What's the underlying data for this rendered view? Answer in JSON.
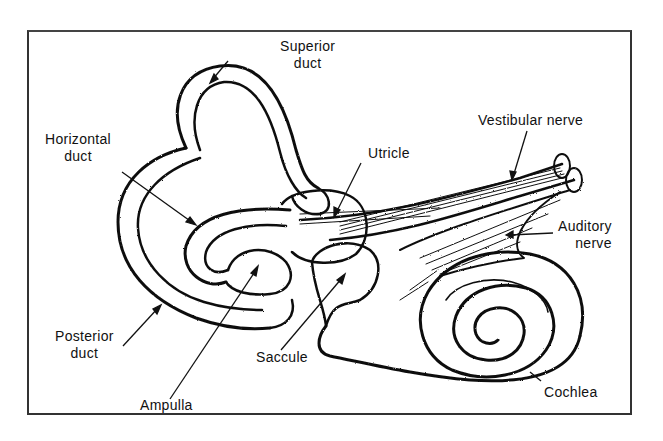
{
  "diagram": {
    "labels": {
      "superior_duct": {
        "line1": "Superior",
        "line2": "duct"
      },
      "horizontal_duct": {
        "line1": "Horizontal",
        "line2": "duct"
      },
      "utricle": {
        "line1": "Utricle"
      },
      "vestibular_nerve": {
        "line1": "Vestibular nerve"
      },
      "auditory_nerve": {
        "line1": "Auditory",
        "line2": "nerve"
      },
      "posterior_duct": {
        "line1": "Posterior",
        "line2": "duct"
      },
      "saccule": {
        "line1": "Saccule"
      },
      "ampulla": {
        "line1": "Ampulla"
      },
      "cochlea": {
        "line1": "Cochlea"
      }
    },
    "colors": {
      "ink": "#111111",
      "background": "#ffffff",
      "frame": "#333333"
    }
  }
}
